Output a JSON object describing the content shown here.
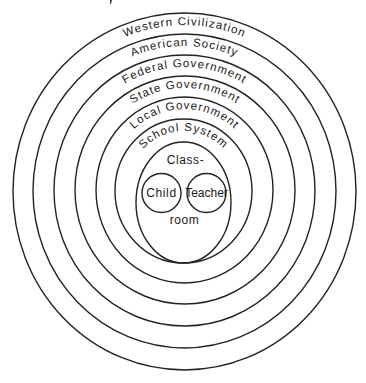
{
  "diagram": {
    "type": "concentric-rings",
    "rings": [
      {
        "label": "Western Civilization",
        "cx": 184.5,
        "cy": 191.5,
        "rx": 171.5,
        "ry": 178.5
      },
      {
        "label": "American Society",
        "cx": 184.5,
        "cy": 191,
        "rx": 151.5,
        "ry": 157
      },
      {
        "label": "Federal Government",
        "cx": 184.5,
        "cy": 190.5,
        "rx": 130.5,
        "ry": 135.5
      },
      {
        "label": "State Government",
        "cx": 185,
        "cy": 190,
        "rx": 110,
        "ry": 114
      },
      {
        "label": "Local Government",
        "cx": 184.5,
        "cy": 190,
        "rx": 88.5,
        "ry": 93
      },
      {
        "label": "School System",
        "cx": 183.5,
        "cy": 191,
        "rx": 68.5,
        "ry": 72
      }
    ],
    "classroom": {
      "label_top": "Class-",
      "label_bottom": "room",
      "cx": 183.5,
      "cy": 202.5,
      "rx": 47.5,
      "ry": 60.5
    },
    "inner_circles": [
      {
        "label": "Child",
        "cx": 161.5,
        "cy": 193,
        "r": 19.5
      },
      {
        "label": "Teacher",
        "cx": 206.5,
        "cy": 193,
        "r": 19.5
      }
    ],
    "stroke_color": "#222222",
    "background": "#ffffff"
  }
}
